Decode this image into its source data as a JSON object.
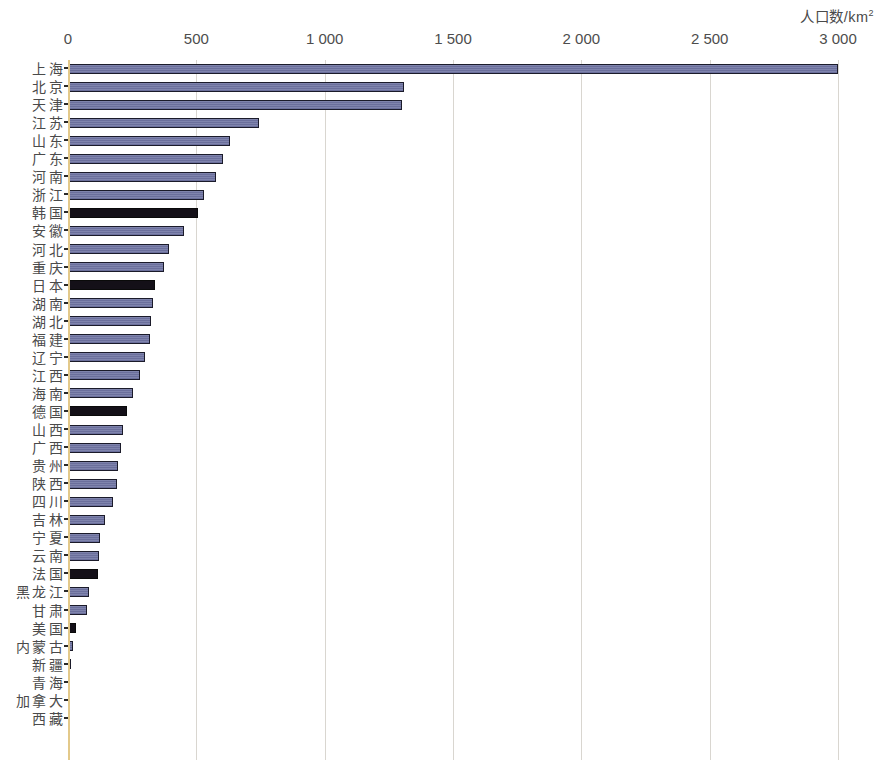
{
  "chart_data": {
    "type": "bar",
    "orientation": "horizontal",
    "title": "",
    "xlabel": "人口数/km²",
    "ylabel": "",
    "xlim": [
      0,
      3000
    ],
    "grid": true,
    "legend": false,
    "axis_title": "人口数/km",
    "axis_title_sup": "2",
    "tick_labels": [
      "0",
      "500",
      "1 000",
      "1 500",
      "2 000",
      "2 500",
      "3 000"
    ],
    "tick_values": [
      0,
      500,
      1000,
      1500,
      2000,
      2500,
      3000
    ],
    "series_name": "人口密度",
    "categories": [
      "上海",
      "北京",
      "天津",
      "江苏",
      "山东",
      "广东",
      "河南",
      "浙江",
      "韩国",
      "安徽",
      "河北",
      "重庆",
      "日本",
      "湖南",
      "湖北",
      "福建",
      "辽宁",
      "江西",
      "海南",
      "德国",
      "山西",
      "广西",
      "贵州",
      "陕西",
      "四川",
      "吉林",
      "宁夏",
      "云南",
      "法国",
      "黑龙江",
      "甘肃",
      "美国",
      "内蒙古",
      "新疆",
      "青海",
      "加拿大",
      "西藏"
    ],
    "values": [
      3000,
      1310,
      1300,
      745,
      630,
      605,
      575,
      530,
      505,
      450,
      395,
      375,
      340,
      330,
      325,
      320,
      300,
      280,
      255,
      230,
      215,
      205,
      195,
      190,
      175,
      145,
      125,
      120,
      115,
      80,
      75,
      33,
      21,
      12,
      8,
      4,
      2
    ],
    "value_types": [
      "province",
      "province",
      "province",
      "province",
      "province",
      "province",
      "province",
      "province",
      "country",
      "province",
      "province",
      "province",
      "country",
      "province",
      "province",
      "province",
      "province",
      "province",
      "province",
      "country",
      "province",
      "province",
      "province",
      "province",
      "province",
      "province",
      "province",
      "province",
      "country",
      "province",
      "province",
      "country",
      "province",
      "province",
      "province",
      "country",
      "province"
    ],
    "colors": {
      "province": "#767ba5",
      "country": "#141018",
      "gridline": "#d9d6d0",
      "axis": "#e3c98a",
      "text": "#4a4a4a"
    }
  }
}
